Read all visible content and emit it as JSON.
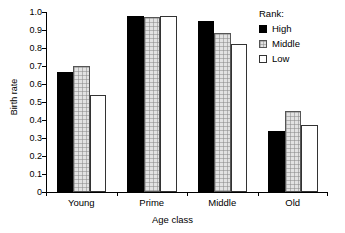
{
  "chart_data": {
    "type": "bar",
    "title": "",
    "xlabel": "Age class",
    "ylabel": "Birth rate",
    "categories": [
      "Young",
      "Prime",
      "Middle",
      "Old"
    ],
    "series": [
      {
        "name": "High",
        "values": [
          0.665,
          0.98,
          0.95,
          0.34
        ]
      },
      {
        "name": "Middle",
        "values": [
          0.7,
          0.97,
          0.885,
          0.45
        ]
      },
      {
        "name": "Low",
        "values": [
          0.54,
          0.98,
          0.82,
          0.37
        ]
      }
    ],
    "ylim": [
      0,
      1.0
    ],
    "ytick_labels": [
      "0",
      "0.1",
      "0.2",
      "0.3",
      "0.4",
      "0.5",
      "0.6",
      "0.7",
      "0.8",
      "0.9",
      "1.0"
    ],
    "ytick_values": [
      0,
      0.1,
      0.2,
      0.3,
      0.4,
      0.5,
      0.6,
      0.7,
      0.8,
      0.9,
      1.0
    ],
    "grid": false,
    "legend": {
      "title": "Rank:",
      "position": "top-right",
      "entries": [
        {
          "label": "High",
          "fill": "#000000",
          "pattern": "solid"
        },
        {
          "label": "Middle",
          "fill": "#e2e2e2",
          "pattern": "checkered"
        },
        {
          "label": "Low",
          "fill": "#ffffff",
          "pattern": "empty"
        }
      ]
    },
    "colors": {
      "high": "#000000",
      "middle": "#e2e2e2",
      "low": "#ffffff",
      "axis": "#000000",
      "background": "#ffffff"
    }
  }
}
